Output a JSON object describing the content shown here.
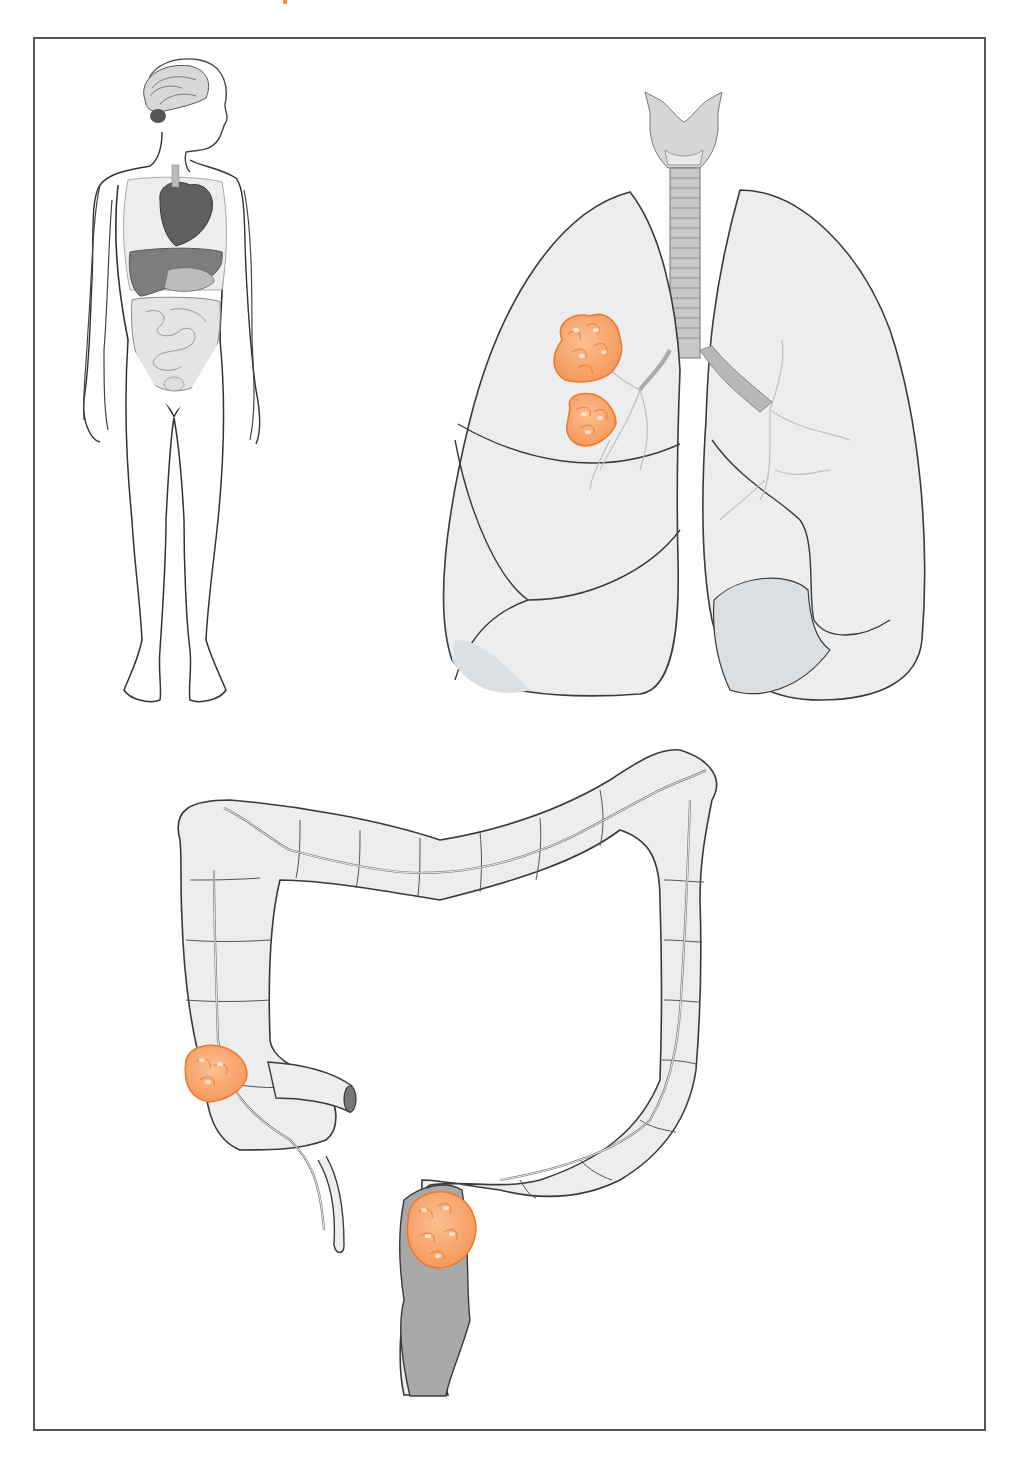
{
  "figure": {
    "type": "anatomical-illustration",
    "panels": [
      {
        "id": "body-overview",
        "label": "Full body with internal organs (brain, heart, lungs, liver, stomach, intestines)"
      },
      {
        "id": "lungs",
        "label": "Trachea, larynx and lungs with tumor in right upper lobe",
        "tumor_count": 2
      },
      {
        "id": "colon",
        "label": "Large intestine (colon) with tumors at cecum and sigmoid colon",
        "tumor_count": 2
      }
    ],
    "colors": {
      "tumor_fill": "#f5a16b",
      "tumor_stroke": "#ee7a2e",
      "tumor_highlight": "#fde3cf",
      "organ_fill": "#e6e8ea",
      "organ_dark": "#9a9a9a",
      "outline": "#3a3a3a",
      "frame": "#555555"
    }
  }
}
